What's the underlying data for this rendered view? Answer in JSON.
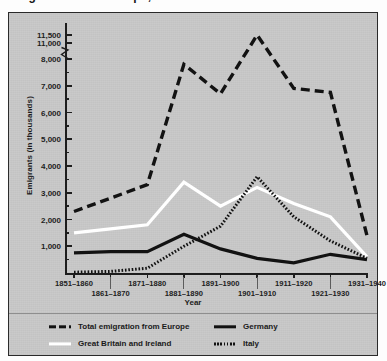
{
  "caption": {
    "text": "Emigration from Europe, 1851–1940"
  },
  "chart_data": {
    "type": "line",
    "title": "",
    "xlabel": "Year",
    "ylabel": "Emigrants (in thousands)",
    "categories": [
      "1851–1860",
      "1861–1870",
      "1871–1880",
      "1881–1890",
      "1891–1900",
      "1901–1910",
      "1911–1920",
      "1921–1930",
      "1931–1940"
    ],
    "ylim": [
      0,
      11500
    ],
    "yticks_major": [
      1000,
      2000,
      3000,
      4000,
      5000,
      6000,
      7000,
      8000,
      11000,
      11500
    ],
    "ytick_labels": [
      "1,000",
      "2,000",
      "3,000",
      "4,000",
      "5,000",
      "6,000",
      "7,000",
      "8,000",
      "11,000",
      "11,500"
    ],
    "axis_break": {
      "present": true,
      "between": [
        8000,
        11000
      ]
    },
    "grid": false,
    "legend_position": "bottom",
    "series": [
      {
        "name": "Total emigration from Europe",
        "style": "dashed",
        "color": "#121212",
        "values": [
          2300,
          2800,
          3300,
          7800,
          6700,
          11500,
          6900,
          6750,
          1400
        ]
      },
      {
        "name": "Great Britain and Ireland",
        "style": "solid",
        "color": "#ffffff",
        "values": [
          1500,
          1650,
          1800,
          3400,
          2500,
          3200,
          2600,
          2100,
          600
        ]
      },
      {
        "name": "Germany",
        "style": "solid",
        "color": "#121212",
        "values": [
          750,
          800,
          800,
          1450,
          900,
          550,
          380,
          700,
          500
        ]
      },
      {
        "name": "Italy",
        "style": "dotted",
        "color": "#121212",
        "values": [
          30,
          60,
          180,
          1000,
          1750,
          3600,
          2100,
          1200,
          550
        ]
      }
    ]
  },
  "legend": {
    "items": [
      {
        "label": "Total emigration from Europe",
        "swatch": "dashed-black",
        "column": "left"
      },
      {
        "label": "Great Britain and Ireland",
        "swatch": "solid-white",
        "column": "left"
      },
      {
        "label": "Germany",
        "swatch": "solid-black",
        "column": "right"
      },
      {
        "label": "Italy",
        "swatch": "dotted-black",
        "column": "right"
      }
    ]
  }
}
